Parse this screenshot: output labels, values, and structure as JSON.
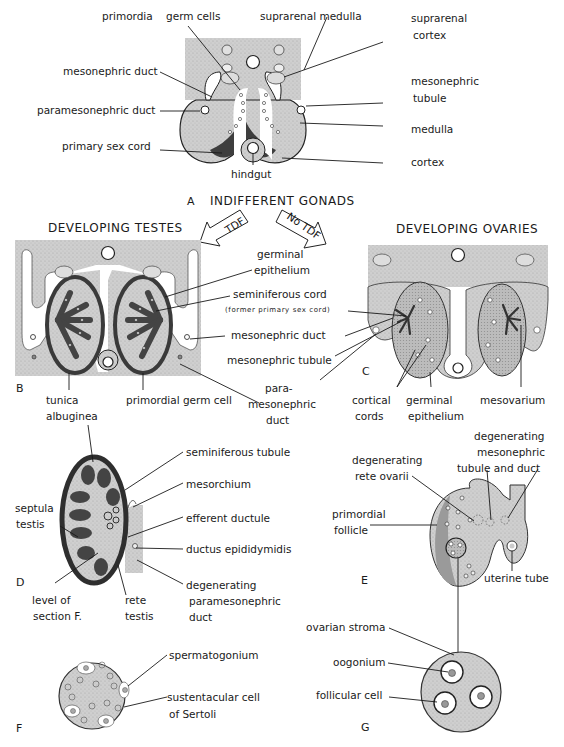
{
  "figure": {
    "colors": {
      "tissue": "#c9c9c9",
      "dark_tissue": "#3e3e3e",
      "outline": "#222222",
      "background": "#ffffff"
    },
    "panel_A": {
      "letter": "A",
      "caption": "INDIFFERENT GONADS",
      "labels": {
        "primordia": "primordia",
        "germ_cells": "germ cells",
        "suprarenal_medulla": "suprarenal medulla",
        "suprarenal_cortex_1": "suprarenal",
        "suprarenal_cortex_2": "cortex",
        "mesonephric_duct": "mesonephric duct",
        "paramesonephric_duct": "paramesonephric duct",
        "primary_sex_cord": "primary sex cord",
        "hindgut": "hindgut",
        "mesonephric_tubule_1": "mesonephric",
        "mesonephric_tubule_2": "tubule",
        "medulla": "medulla",
        "cortex": "cortex"
      }
    },
    "arrows": {
      "left": "TDF",
      "right": "No TDF"
    },
    "panel_B": {
      "letter": "B",
      "caption": "DEVELOPING TESTES",
      "labels": {
        "germinal_epithelium_1": "germinal",
        "germinal_epithelium_2": "epithelium",
        "seminiferous_cord": "seminiferous cord",
        "former_primary_sex_cord": "(former primary sex cord)",
        "mesonephric_duct": "mesonephric duct",
        "mesonephric_tubule": "mesonephric tubule",
        "paramesonephric_duct_1": "para-",
        "paramesonephric_duct_2": "mesonephric",
        "paramesonephric_duct_3": "duct",
        "tunica_albuginea_1": "tunica",
        "tunica_albuginea_2": "albuginea",
        "primordial_germ_cell": "primordial germ cell"
      }
    },
    "panel_C": {
      "letter": "C",
      "caption": "DEVELOPING OVARIES",
      "labels": {
        "cortical_cords_1": "cortical",
        "cortical_cords_2": "cords",
        "germinal_epithelium_1": "germinal",
        "germinal_epithelium_2": "epithelium",
        "mesovarium": "mesovarium"
      }
    },
    "panel_D": {
      "letter": "D",
      "labels": {
        "seminiferous_tubule": "seminiferous tubule",
        "mesorchium": "mesorchium",
        "septula_testis_1": "septula",
        "septula_testis_2": "testis",
        "efferent_ductule": "efferent ductule",
        "ductus_epididymidis": "ductus epididymidis",
        "degenerating_pmd_1": "degenerating",
        "degenerating_pmd_2": "paramesonephric",
        "degenerating_pmd_3": "duct",
        "level_of_section_1": "level of",
        "level_of_section_2": "section F.",
        "rete_testis_1": "rete",
        "rete_testis_2": "testis"
      }
    },
    "panel_E": {
      "letter": "E",
      "labels": {
        "deg_mesonephric_1": "degenerating",
        "deg_mesonephric_2": "mesonephric",
        "deg_mesonephric_3": "tubule and duct",
        "deg_rete_ovarii_1": "degenerating",
        "deg_rete_ovarii_2": "rete ovarii",
        "primordial_follicle_1": "primordial",
        "primordial_follicle_2": "follicle",
        "uterine_tube": "uterine tube"
      }
    },
    "panel_F": {
      "letter": "F",
      "labels": {
        "spermatogonium": "spermatogonium",
        "sertoli_1": "sustentacular cell",
        "sertoli_2": "of Sertoli"
      }
    },
    "panel_G": {
      "letter": "G",
      "labels": {
        "ovarian_stroma": "ovarian stroma",
        "oogonium": "oogonium",
        "follicular_cell": "follicular cell"
      }
    }
  }
}
